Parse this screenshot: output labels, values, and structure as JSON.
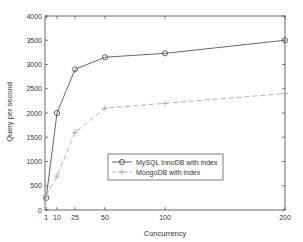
{
  "chart_data": {
    "type": "line",
    "title": "",
    "xlabel": "Concurrency",
    "ylabel": "Query per second",
    "x": [
      1,
      10,
      25,
      50,
      100,
      200
    ],
    "xticks": [
      "1",
      "10",
      "25",
      "50",
      "100",
      "200"
    ],
    "yticks": [
      "0",
      "500",
      "1000",
      "1500",
      "2000",
      "2500",
      "3000",
      "3500",
      "4000"
    ],
    "xlim": [
      0,
      200
    ],
    "ylim": [
      0,
      4000
    ],
    "grid": false,
    "legend_position": "center-right",
    "series": [
      {
        "name": "MySQL InnoDB with index",
        "marker": "circle",
        "line": "solid",
        "color": "#555555",
        "values": [
          250,
          2000,
          2900,
          3150,
          3230,
          3500
        ]
      },
      {
        "name": "MongoDB with index",
        "marker": "plus",
        "line": "dashed",
        "color": "#aaaaaa",
        "values": [
          300,
          700,
          1600,
          2100,
          2200,
          2400
        ]
      }
    ]
  }
}
